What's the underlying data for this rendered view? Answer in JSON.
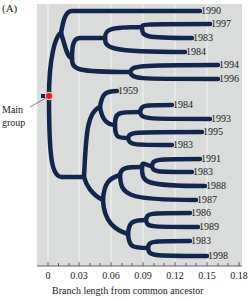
{
  "panel_label": "(A)",
  "callout": {
    "line1": "Main",
    "line2": "group"
  },
  "colors": {
    "branch": "#12264d",
    "panel_bg": "#d9dcdb",
    "gridline": "#f2f2f2",
    "root_dot": "#d2232a",
    "root_halo": "#f5b6b6"
  },
  "axis": {
    "title": "Branch length from common ancestor",
    "ticks": [
      {
        "label": "0",
        "x": 48
      },
      {
        "label": "0.03",
        "x": 79
      },
      {
        "label": "0.06",
        "x": 111
      },
      {
        "label": "0.09",
        "x": 143
      },
      {
        "label": "0.12",
        "x": 175
      },
      {
        "label": "0.15",
        "x": 207
      },
      {
        "label": "0.18",
        "x": 239
      }
    ]
  },
  "leaves": [
    {
      "label": "1990",
      "y": 11,
      "x": 200
    },
    {
      "label": "1997",
      "y": 24,
      "x": 210
    },
    {
      "label": "1983",
      "y": 38,
      "x": 192
    },
    {
      "label": "1984",
      "y": 52,
      "x": 185
    },
    {
      "label": "1994",
      "y": 65,
      "x": 218
    },
    {
      "label": "1996",
      "y": 79,
      "x": 218
    },
    {
      "label": "1959",
      "y": 91,
      "x": 117
    },
    {
      "label": "1984",
      "y": 105,
      "x": 172
    },
    {
      "label": "1993",
      "y": 119,
      "x": 210
    },
    {
      "label": "1995",
      "y": 132,
      "x": 202
    },
    {
      "label": "1983",
      "y": 145,
      "x": 172
    },
    {
      "label": "1991",
      "y": 159,
      "x": 200
    },
    {
      "label": "1983",
      "y": 172,
      "x": 192
    },
    {
      "label": "1988",
      "y": 186,
      "x": 205
    },
    {
      "label": "1987",
      "y": 200,
      "x": 196
    },
    {
      "label": "1986",
      "y": 213,
      "x": 190
    },
    {
      "label": "1989",
      "y": 227,
      "x": 198
    },
    {
      "label": "1983",
      "y": 241,
      "x": 190
    },
    {
      "label": "1998",
      "y": 256,
      "x": 207
    }
  ]
}
